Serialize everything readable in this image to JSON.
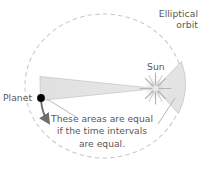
{
  "diagram": {
    "title_label": "Elliptical orbit",
    "elliptical_line1": "Elliptical",
    "elliptical_line2": "orbit",
    "sun_label": "Sun",
    "planet_label": "Planet",
    "caption_line1": "These areas are equal",
    "caption_line2": "if the time intervals",
    "caption_line3": "are equal.",
    "colors": {
      "background": "#ffffff",
      "text": "#58585a",
      "orbit_dashed": "#c9c9cc",
      "wedge_fill": "#e3e3e3",
      "wedge_stroke": "#c2c2c2",
      "planet_dot": "#000000",
      "leader_line": "#a8a8ac",
      "sun_glow": "#dcdcdc",
      "arrow": "#6e6e72"
    },
    "elements": {
      "orbit_shape": "ellipse-dashed",
      "sun_icon": "sun-starburst-icon",
      "planet_icon": "planet-dot-icon",
      "motion_arrow": "curved-direction-arrow",
      "left_sector": "swept-area-wedge-left",
      "right_sector": "swept-area-wedge-right"
    }
  }
}
